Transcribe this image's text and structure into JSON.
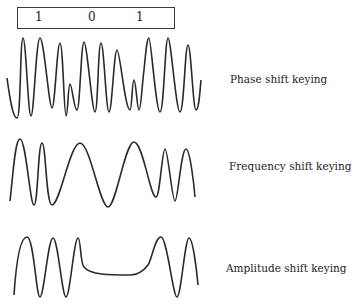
{
  "bit_sequence": {
    "bits": [
      "1",
      "0",
      "1"
    ]
  },
  "waveforms": [
    {
      "name": "psk",
      "label": "Phase shift keying"
    },
    {
      "name": "fsk",
      "label": "Frequency shift keying"
    },
    {
      "name": "ask",
      "label": "Amplitude shift keying"
    }
  ],
  "colors": {
    "stroke": "#2a2a2a",
    "text": "#222222",
    "background": "#ffffff"
  }
}
